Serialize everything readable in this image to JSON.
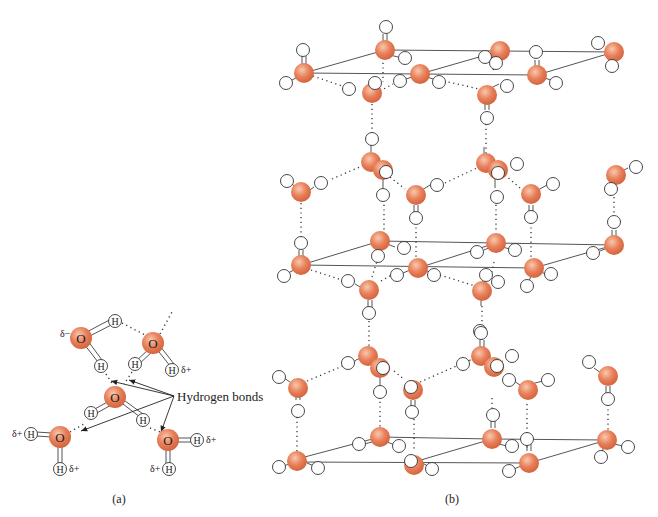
{
  "figure": {
    "panel_a": {
      "caption": "(a)",
      "annotation": "Hydrogen bonds",
      "oxygen_label": "O",
      "hydrogen_label": "H",
      "delta_minus": "δ−",
      "delta_plus": "δ+"
    },
    "panel_b": {
      "caption": "(b)"
    },
    "colors": {
      "oxygen": "#e8805a",
      "oxygen_highlight": "#f6c2a8",
      "hydrogen": "#ffffff",
      "bond": "#555555"
    }
  }
}
